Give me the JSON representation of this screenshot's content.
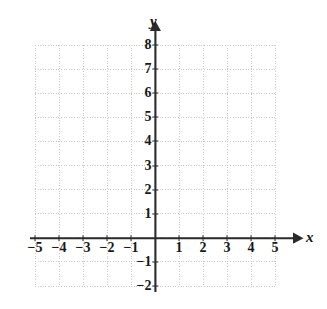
{
  "figure": {
    "kind": "cartesian-coordinate-grid",
    "background_color": "#ffffff",
    "axis_color": "#2b2b2b",
    "grid_color": "#c8c8c8",
    "label_color": "#181818"
  },
  "axes": {
    "x_axis_label": "x",
    "y_axis_label": "y",
    "x_arrow": "arrow-right",
    "y_arrow": "arrow-up"
  },
  "chart_data": {
    "type": "scatter",
    "title": "",
    "subtitle": "",
    "xlabel": "x",
    "ylabel": "y",
    "xlim": [
      -5,
      5
    ],
    "ylim": [
      -2,
      8
    ],
    "xticks": [
      -5,
      -4,
      -3,
      -2,
      -1,
      1,
      2,
      3,
      4,
      5
    ],
    "yticks": [
      8,
      7,
      6,
      5,
      4,
      3,
      2,
      1,
      -1,
      -2
    ],
    "xtick_labels": [
      "−5",
      "−4",
      "−3",
      "−2",
      "−1",
      "1",
      "2",
      "3",
      "4",
      "5"
    ],
    "ytick_labels": [
      "8",
      "7",
      "6",
      "5",
      "4",
      "3",
      "2",
      "1",
      "−1",
      "−2"
    ],
    "grid": true,
    "grid_style": "dotted",
    "legend": null,
    "series": [],
    "annotations": [],
    "note": "Empty graph paper: no data points, curves, or shaded regions are plotted."
  },
  "x_ticks": [
    {
      "value": -5,
      "label": "−5",
      "px": 35
    },
    {
      "value": -4,
      "label": "−4",
      "px": 59
    },
    {
      "value": -3,
      "label": "−3",
      "px": 83
    },
    {
      "value": -2,
      "label": "−2",
      "px": 107
    },
    {
      "value": -1,
      "label": "−1",
      "px": 131
    },
    {
      "value": 1,
      "label": "1",
      "px": 179
    },
    {
      "value": 2,
      "label": "2",
      "px": 203
    },
    {
      "value": 3,
      "label": "3",
      "px": 227
    },
    {
      "value": 4,
      "label": "4",
      "px": 251
    },
    {
      "value": 5,
      "label": "5",
      "px": 275
    }
  ],
  "y_ticks": [
    {
      "value": 8,
      "label": "8",
      "px": 45
    },
    {
      "value": 7,
      "label": "7",
      "px": 69
    },
    {
      "value": 6,
      "label": "6",
      "px": 93
    },
    {
      "value": 5,
      "label": "5",
      "px": 117
    },
    {
      "value": 4,
      "label": "4",
      "px": 141
    },
    {
      "value": 3,
      "label": "3",
      "px": 166
    },
    {
      "value": 2,
      "label": "2",
      "px": 190
    },
    {
      "value": 1,
      "label": "1",
      "px": 214
    },
    {
      "value": -1,
      "label": "−1",
      "px": 262
    },
    {
      "value": -2,
      "label": "−2",
      "px": 286
    }
  ]
}
